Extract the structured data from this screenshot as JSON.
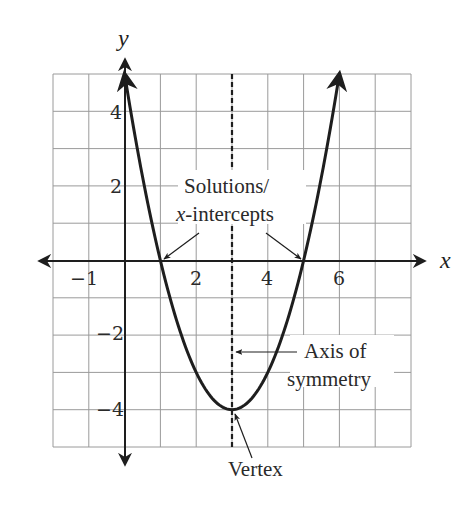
{
  "chart_data": {
    "type": "line",
    "title": "",
    "function": "y = x^2 - 6x + 5",
    "xlabel": "x",
    "ylabel": "y",
    "xlim": [
      -2,
      8
    ],
    "ylim": [
      -5,
      5
    ],
    "grid": true,
    "x_ticks": [
      {
        "value": -1,
        "label": "−1"
      },
      {
        "value": 2,
        "label": "2"
      },
      {
        "value": 4,
        "label": "4"
      },
      {
        "value": 6,
        "label": "6"
      }
    ],
    "y_ticks": [
      {
        "value": 4,
        "label": "4"
      },
      {
        "value": 2,
        "label": "2"
      },
      {
        "value": -2,
        "label": "−2"
      },
      {
        "value": -4,
        "label": "−4"
      }
    ],
    "series": [
      {
        "name": "parabola",
        "x": [
          0,
          0.5,
          1,
          1.5,
          2,
          2.5,
          3,
          3.5,
          4,
          4.5,
          5,
          5.5,
          6
        ],
        "y": [
          5,
          2.25,
          0,
          -1.75,
          -3,
          -3.75,
          -4,
          -3.75,
          -3,
          -1.75,
          0,
          2.25,
          5
        ]
      }
    ],
    "x_intercepts": [
      1,
      5
    ],
    "vertex": {
      "x": 3,
      "y": -4
    },
    "axis_of_symmetry": {
      "x": 3,
      "style": "dashed"
    },
    "annotations": [
      {
        "id": "solutions",
        "lines": [
          "Solutions/",
          "x-intercepts"
        ],
        "points_to": [
          [
            1,
            0
          ],
          [
            5,
            0
          ]
        ]
      },
      {
        "id": "axis",
        "lines": [
          "Axis of",
          "symmetry"
        ],
        "points_to": [
          [
            3,
            -2.5
          ]
        ]
      },
      {
        "id": "vertex",
        "lines": [
          "Vertex"
        ],
        "points_to": [
          [
            3,
            -4
          ]
        ]
      }
    ]
  },
  "labels": {
    "x_axis": "x",
    "y_axis": "y",
    "tick_x_m1": "−1",
    "tick_x_2": "2",
    "tick_x_4": "4",
    "tick_x_6": "6",
    "tick_y_4": "4",
    "tick_y_2": "2",
    "tick_y_m2": "−2",
    "tick_y_m4": "−4",
    "solutions_line1": "Solutions/",
    "solutions_line2_italic": "x",
    "solutions_line2_rest": "-intercepts",
    "axis_line1": "Axis of",
    "axis_line2": "symmetry",
    "vertex": "Vertex"
  },
  "colors": {
    "ink": "#1e1e1e",
    "grid": "#9a9a9a",
    "background": "#ffffff"
  }
}
